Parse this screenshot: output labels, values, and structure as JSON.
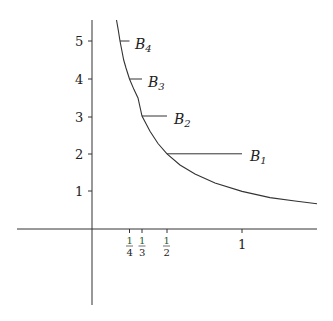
{
  "figure": {
    "function": "y = 1/x",
    "colors": {
      "line": "#333333",
      "text": "#222222",
      "fraction_numerator": "#2a5a2a"
    }
  },
  "axes": {
    "y_ticks": [
      {
        "value": 1,
        "label": "1"
      },
      {
        "value": 2,
        "label": "2"
      },
      {
        "value": 3,
        "label": "3"
      },
      {
        "value": 4,
        "label": "4"
      },
      {
        "value": 5,
        "label": "5"
      }
    ],
    "x_ticks": [
      {
        "value": 0.25,
        "num": "1",
        "den": "4"
      },
      {
        "value": 0.3333,
        "num": "1",
        "den": "3"
      },
      {
        "value": 0.5,
        "num": "1",
        "den": "2"
      },
      {
        "value": 1,
        "label": "1"
      }
    ]
  },
  "segments": [
    {
      "name": "B",
      "sub": "1",
      "y": 2,
      "x_start": 0.5,
      "x_end": 1
    },
    {
      "name": "B",
      "sub": "2",
      "y": 3,
      "x_start": 0.3333,
      "x_end": 0.5
    },
    {
      "name": "B",
      "sub": "3",
      "y": 4,
      "x_start": 0.25,
      "x_end": 0.3333
    },
    {
      "name": "B",
      "sub": "4",
      "y": 5,
      "x_start": 0.2,
      "x_end": 0.25
    }
  ]
}
